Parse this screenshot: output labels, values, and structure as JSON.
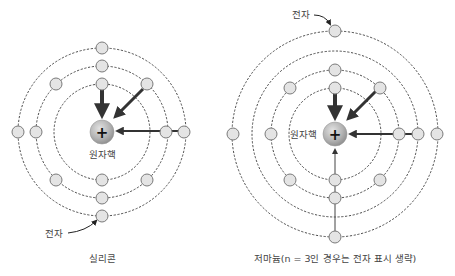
{
  "colors": {
    "orbit": "#3a3a3a",
    "electron_fill": "#e4e4e4",
    "electron_stroke": "#7a7a7a",
    "nucleus_light": "#d8d8d8",
    "nucleus_dark": "#8e8e8e",
    "arrow": "#333333"
  },
  "silicon": {
    "caption": "실리콘",
    "nucleus_label": "원자핵",
    "nucleus_symbol": "+",
    "electron_label": "전자",
    "shells": 3,
    "electrons_per_shell": [
      2,
      8,
      4
    ]
  },
  "germanium": {
    "caption": "저마늄(n = 3인 경우는 전자 표시 생략)",
    "nucleus_label": "원자핵",
    "nucleus_symbol": "+",
    "electron_label": "전자",
    "shells": 4,
    "electrons_shown_per_shell": [
      2,
      8,
      "omitted",
      4
    ]
  }
}
